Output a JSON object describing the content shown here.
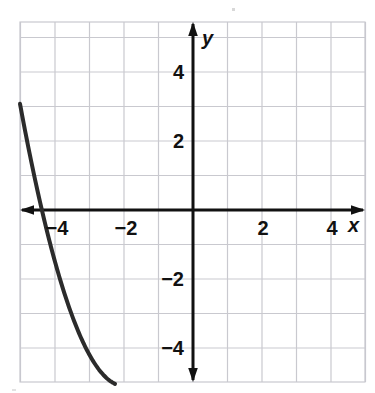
{
  "figure": {
    "kind": "cartesian-graph",
    "background_color": "#ffffff",
    "grid_color": "#c9c9cf",
    "axis_color": "#111111",
    "curve_color": "#2b2b2b",
    "plot_box": {
      "left": 20,
      "top": 22,
      "right": 365,
      "bottom": 382
    },
    "origin": {
      "x": 193,
      "y": 210
    },
    "unit_px": 34.5
  },
  "axes": {
    "x_axis_label": "x",
    "y_axis_label": "y",
    "x_tick_labels": [
      {
        "text": "−4",
        "value": -4
      },
      {
        "text": "−2",
        "value": -2
      },
      {
        "text": "2",
        "value": 2
      },
      {
        "text": "4",
        "value": 4
      }
    ],
    "y_tick_labels": [
      {
        "text": "4",
        "value": 4
      },
      {
        "text": "2",
        "value": 2
      },
      {
        "text": "−2",
        "value": -2
      },
      {
        "text": "−4",
        "value": -4
      }
    ]
  },
  "chart_data": {
    "type": "line",
    "title": "",
    "subtitle": "",
    "xlabel": "x",
    "ylabel": "y",
    "xlim": [
      -5.0,
      5.0
    ],
    "ylim": [
      -5.45,
      5.45
    ],
    "grid": true,
    "grid_step": 1,
    "legend": null,
    "legend_position": "none",
    "annotations": [],
    "series": [
      {
        "name": "parabola",
        "equation": "y = 0.9(x + 2)^2 - 5.1",
        "vertex": [
          -2.0,
          -5.1
        ],
        "y_intercept": -1.5,
        "x_intercepts": [
          -4.38,
          0.38
        ],
        "opens": "up",
        "x": [
          -4.9,
          -4.6,
          -4.3,
          -4.0,
          -3.7,
          -3.4,
          -3.1,
          -2.8,
          -2.5,
          -2.2,
          -1.9,
          -1.6,
          -1.3,
          -1.0,
          -0.7,
          -0.4,
          -0.1,
          0.2,
          0.5,
          0.8,
          1.1,
          1.4
        ],
        "values": [
          2.42,
          1.46,
          0.62,
          -0.9,
          -1.98,
          -2.93,
          -3.76,
          -4.52,
          -4.88,
          -5.06,
          -5.09,
          -4.96,
          -4.66,
          -4.2,
          -3.58,
          -2.8,
          -1.87,
          -0.74,
          0.53,
          1.96,
          3.55,
          5.3
        ]
      }
    ]
  }
}
